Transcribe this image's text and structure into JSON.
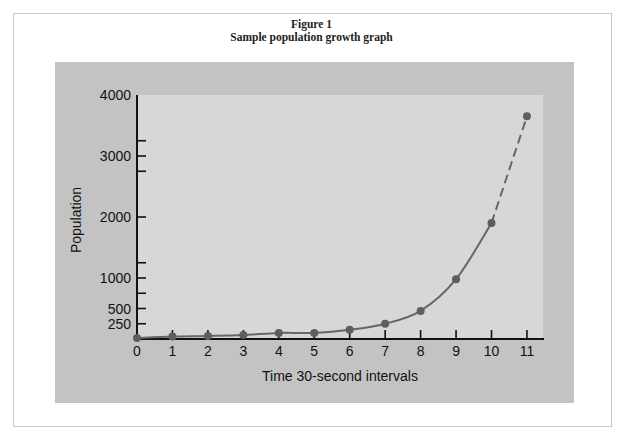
{
  "figure": {
    "title_line1": "Figure 1",
    "title_line2": "Sample population growth graph"
  },
  "colors": {
    "panel": "#c3c3c3",
    "plot_area": "#d7d7d7",
    "axis": "#111111",
    "curve": "#666666",
    "marker": "#5e5e5e"
  },
  "chart_data": {
    "type": "line",
    "title": "Sample population growth graph",
    "subtitle": "Figure 1",
    "xlabel": "Time 30-second intervals",
    "ylabel": "Population",
    "x": [
      0,
      1,
      2,
      3,
      4,
      5,
      6,
      7,
      8,
      9,
      10,
      11
    ],
    "series": [
      {
        "name": "Population",
        "values": [
          15,
          40,
          50,
          65,
          100,
          100,
          150,
          250,
          460,
          980,
          1900,
          3650
        ],
        "style": "solid line with markers; segment from x=10 to x=11 dashed (extrapolated)"
      }
    ],
    "x_ticks": [
      "0",
      "1",
      "2",
      "3",
      "4",
      "5",
      "6",
      "7",
      "8",
      "9",
      "10",
      "11"
    ],
    "y_tick_labels": [
      "250",
      "500",
      "1000",
      "2000",
      "3000",
      "4000"
    ],
    "y_tick_values": [
      250,
      500,
      1000,
      2000,
      3000,
      4000
    ],
    "y_minor_ticks": [
      750,
      1250,
      2750,
      3250
    ],
    "xlim": [
      0,
      11.5
    ],
    "ylim": [
      0,
      4000
    ],
    "grid": false,
    "legend": null
  }
}
